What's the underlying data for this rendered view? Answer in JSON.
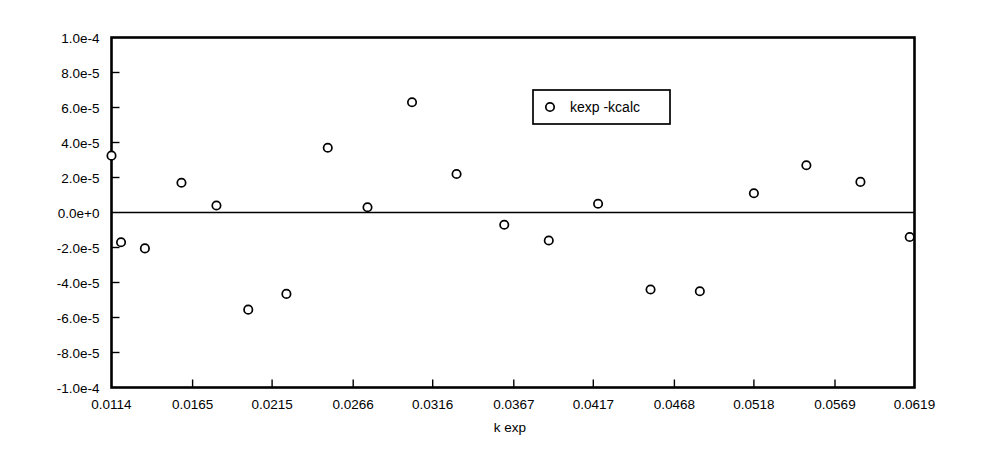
{
  "chart_data": {
    "type": "scatter",
    "title": "",
    "subtitle": "",
    "xlabel": "k exp",
    "ylabel": "",
    "xlim": [
      0.0114,
      0.0619
    ],
    "ylim": [
      -0.0001,
      0.0001
    ],
    "grid": false,
    "legend_position": "top-center-right",
    "zero_reference_line": 0,
    "x_tick_labels": [
      "0.0114",
      "0.0165",
      "0.0215",
      "0.0266",
      "0.0316",
      "0.0367",
      "0.0417",
      "0.0468",
      "0.0518",
      "0.0569",
      "0.0619"
    ],
    "x_tick_values": [
      0.0114,
      0.0165,
      0.0215,
      0.0266,
      0.0316,
      0.0367,
      0.0417,
      0.0468,
      0.0518,
      0.0569,
      0.0619
    ],
    "y_tick_labels": [
      "1.0e-4",
      "8.0e-5",
      "6.0e-5",
      "4.0e-5",
      "2.0e-5",
      "0.0e+0",
      "-2.0e-5",
      "-4.0e-5",
      "-6.0e-5",
      "-8.0e-5",
      "-1.0e-4"
    ],
    "y_tick_values": [
      0.0001,
      8e-05,
      6e-05,
      4e-05,
      2e-05,
      0,
      -2e-05,
      -4e-05,
      -6e-05,
      -8e-05,
      -0.0001
    ],
    "series": [
      {
        "name": "kexp -kcalc",
        "marker": "open-circle",
        "color": "#000000",
        "x": [
          0.0114,
          0.012,
          0.0135,
          0.0158,
          0.018,
          0.02,
          0.0224,
          0.025,
          0.0275,
          0.0303,
          0.0331,
          0.0361,
          0.0389,
          0.042,
          0.0453,
          0.0484,
          0.0518,
          0.0551,
          0.0585,
          0.0616
        ],
        "y": [
          3.25e-05,
          -1.7e-05,
          -2.05e-05,
          1.7e-05,
          4e-06,
          -5.55e-05,
          -4.65e-05,
          3.7e-05,
          3e-06,
          6.3e-05,
          2.2e-05,
          -7e-06,
          -1.6e-05,
          5e-06,
          -4.4e-05,
          -4.5e-05,
          1.1e-05,
          2.7e-05,
          1.75e-05,
          -1.4e-05
        ]
      }
    ]
  },
  "legend": {
    "entries": [
      {
        "label": "kexp -kcalc",
        "marker": "open-circle"
      }
    ]
  },
  "axes": {
    "x_title": "k exp"
  },
  "colors": {
    "frame": "#000000",
    "marker_stroke": "#000000",
    "marker_fill": "#ffffff",
    "background": "#ffffff"
  }
}
